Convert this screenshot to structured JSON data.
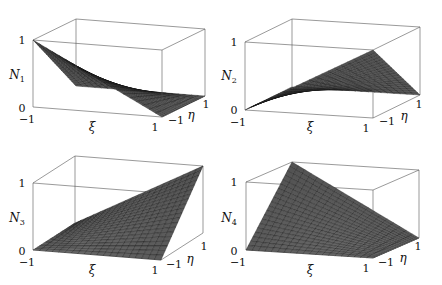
{
  "figure": {
    "width": 442,
    "height": 285,
    "layout": "2x2 grid of 3D surface plots"
  },
  "chart_data": [
    {
      "type": "surface",
      "id": "N1",
      "zlabel": "N",
      "zlabel_sub": "1",
      "xlabel": "ξ",
      "ylabel": "η",
      "xlim": [
        -1,
        1
      ],
      "ylim": [
        -1,
        1
      ],
      "zlim": [
        0,
        1
      ],
      "x_ticks": [
        "−1",
        "1"
      ],
      "y_ticks": [
        "−1",
        "1"
      ],
      "z_ticks": [
        "0",
        "1"
      ],
      "function": "N1 = (1-ξ)(1-η)/4",
      "corner_values": {
        "(-1,-1)": 1,
        "(1,-1)": 0,
        "(1,1)": 0,
        "(-1,1)": 0
      },
      "grid": 20,
      "mesh": true,
      "projection": {
        "origin": [
          33,
          107
        ],
        "xi": [
          129,
          10
        ],
        "eta": [
          43,
          -21
        ],
        "z": [
          0,
          -67
        ]
      },
      "labels_pos": {
        "z1": [
          22,
          44
        ],
        "z0": [
          22,
          112
        ],
        "zname": [
          17,
          79
        ],
        "xm1": [
          27,
          123
        ],
        "x1": [
          155,
          131
        ],
        "xname": [
          92,
          131
        ],
        "ym1": [
          176,
          124
        ],
        "y1": [
          206,
          108
        ],
        "yname": [
          191,
          119
        ]
      }
    },
    {
      "type": "surface",
      "id": "N2",
      "zlabel": "N",
      "zlabel_sub": "2",
      "xlabel": "ξ",
      "ylabel": "η",
      "xlim": [
        -1,
        1
      ],
      "ylim": [
        -1,
        1
      ],
      "zlim": [
        0,
        1
      ],
      "x_ticks": [
        "−1",
        "1"
      ],
      "y_ticks": [
        "−1",
        "1"
      ],
      "z_ticks": [
        "0",
        "1"
      ],
      "function": "N2 = (1+ξ)(1-η)/4",
      "corner_values": {
        "(-1,-1)": 0,
        "(1,-1)": 1,
        "(1,1)": 0,
        "(-1,1)": 0
      },
      "grid": 20,
      "mesh": true,
      "projection": {
        "origin": [
          245,
          110
        ],
        "xi": [
          128,
          8
        ],
        "eta": [
          47,
          -23
        ],
        "z": [
          0,
          -68
        ]
      },
      "labels_pos": {
        "z1": [
          234,
          46
        ],
        "z0": [
          234,
          114
        ],
        "zname": [
          229,
          80
        ],
        "xm1": [
          238,
          126
        ],
        "x1": [
          366,
          132
        ],
        "xname": [
          310,
          131
        ],
        "ym1": [
          387,
          125
        ],
        "y1": [
          419,
          108
        ],
        "yname": [
          404,
          120
        ]
      }
    },
    {
      "type": "surface",
      "id": "N3",
      "zlabel": "N",
      "zlabel_sub": "3",
      "xlabel": "ξ",
      "ylabel": "η",
      "xlim": [
        -1,
        1
      ],
      "ylim": [
        -1,
        1
      ],
      "zlim": [
        0,
        1
      ],
      "x_ticks": [
        "−1",
        "1"
      ],
      "y_ticks": [
        "−1",
        "1"
      ],
      "z_ticks": [
        "0",
        "1"
      ],
      "function": "N3 = (1+ξ)(1+η)/4",
      "corner_values": {
        "(-1,-1)": 0,
        "(1,-1)": 0,
        "(1,1)": 1,
        "(-1,1)": 0
      },
      "grid": 20,
      "mesh": true,
      "projection": {
        "origin": [
          33,
          250
        ],
        "xi": [
          128,
          10
        ],
        "eta": [
          42,
          -27
        ],
        "z": [
          0,
          -67
        ]
      },
      "labels_pos": {
        "z1": [
          22,
          187
        ],
        "z0": [
          22,
          255
        ],
        "zname": [
          17,
          222
        ],
        "xm1": [
          27,
          266
        ],
        "x1": [
          155,
          274
        ],
        "xname": [
          92,
          274
        ],
        "ym1": [
          174,
          268
        ],
        "y1": [
          204,
          250
        ],
        "yname": [
          190,
          263
        ]
      }
    },
    {
      "type": "surface",
      "id": "N4",
      "zlabel": "N",
      "zlabel_sub": "4",
      "xlabel": "ξ",
      "ylabel": "η",
      "xlim": [
        -1,
        1
      ],
      "ylim": [
        -1,
        1
      ],
      "zlim": [
        0,
        1
      ],
      "x_ticks": [
        "−1",
        "1"
      ],
      "y_ticks": [
        "−1",
        "1"
      ],
      "z_ticks": [
        "0",
        "1"
      ],
      "function": "N4 = (1-ξ)(1+η)/4",
      "corner_values": {
        "(-1,-1)": 0,
        "(1,-1)": 0,
        "(1,1)": 0,
        "(-1,1)": 1
      },
      "grid": 20,
      "mesh": true,
      "projection": {
        "origin": [
          246,
          250
        ],
        "xi": [
          127,
          8
        ],
        "eta": [
          46,
          -20
        ],
        "z": [
          0,
          -68
        ]
      },
      "labels_pos": {
        "z1": [
          234,
          186
        ],
        "z0": [
          234,
          255
        ],
        "zname": [
          229,
          222
        ],
        "xm1": [
          238,
          266
        ],
        "x1": [
          366,
          272
        ],
        "xname": [
          310,
          274
        ],
        "ym1": [
          386,
          266
        ],
        "y1": [
          418,
          250
        ],
        "yname": [
          403,
          262
        ]
      }
    }
  ],
  "colors": {
    "background": "#ffffff",
    "box": "#555555",
    "mesh_line": "#111111",
    "surface_light": "#9a9a9a",
    "surface_dark": "#1a1a1a",
    "text": "#111111"
  }
}
